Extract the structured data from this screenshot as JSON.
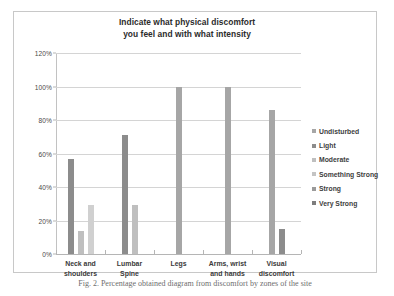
{
  "chart_data": {
    "type": "bar",
    "title": "Indicate what physical discomfort you feel and with what intensity",
    "title_lines": [
      "Indicate what physical discomfort",
      "you feel and with what intensity"
    ],
    "xlabel": "",
    "ylabel": "",
    "ylim": [
      0,
      120
    ],
    "ytick_values": [
      0,
      20,
      40,
      60,
      80,
      100,
      120
    ],
    "ytick_labels": [
      "0%",
      "20%",
      "40%",
      "60%",
      "80%",
      "100%",
      "120%"
    ],
    "grid": true,
    "legend_position": "right",
    "categories": [
      "Neck and shoulders",
      "Lumbar Spine",
      "Legs",
      "Arms, wrist and hands",
      "Visual discomfort"
    ],
    "category_lines": [
      [
        "Neck and",
        "shoulders"
      ],
      [
        "Lumbar",
        "Spine"
      ],
      [
        "Legs"
      ],
      [
        "Arms, wrist",
        "and hands"
      ],
      [
        "Visual",
        "discomfort"
      ]
    ],
    "series": [
      {
        "name": "Undisturbed",
        "color": "#a6a6a6",
        "values": [
          0,
          0,
          100,
          100,
          86
        ]
      },
      {
        "name": "Light",
        "color": "#8c8c8c",
        "values": [
          57,
          71,
          0,
          0,
          15
        ]
      },
      {
        "name": "Moderate",
        "color": "#bfbfbf",
        "values": [
          14,
          29,
          0,
          0,
          0
        ]
      },
      {
        "name": "Something Strong",
        "color": "#d0d0d0",
        "values": [
          29,
          0,
          0,
          0,
          0
        ]
      },
      {
        "name": "Strong",
        "color": "#9a9a9a",
        "values": [
          0,
          0,
          0,
          0,
          0
        ]
      },
      {
        "name": "Very Strong",
        "color": "#7d7d7d",
        "values": [
          0,
          0,
          0,
          0,
          0
        ]
      }
    ]
  },
  "legend": {
    "items": [
      {
        "label": "Undisturbed",
        "color": "#a6a6a6"
      },
      {
        "label": "Light",
        "color": "#8c8c8c"
      },
      {
        "label": "Moderate",
        "color": "#bfbfbf"
      },
      {
        "label": "Something Strong",
        "color": "#c4c4c4"
      },
      {
        "label": "Strong",
        "color": "#9a9a9a"
      },
      {
        "label": "Very Strong",
        "color": "#7d7d7d"
      }
    ]
  },
  "caption": {
    "text": "Fig. 2. Percentage obtained diagram from discomfort by zones of the site"
  }
}
